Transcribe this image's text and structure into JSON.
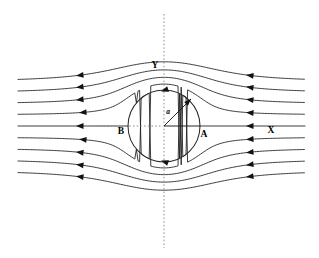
{
  "figure": {
    "background_color": "#ffffff",
    "line_color": "#1a1a1a",
    "axis_color": "#8f8f8f",
    "width": 319,
    "height": 258
  },
  "labels": {
    "top_axis": "Y",
    "right_far_field": "X",
    "right_stagnation": "A",
    "left_stagnation": "B",
    "radius": "a"
  },
  "chart_data": {
    "type": "line",
    "xlabel": "X",
    "ylabel": "Y",
    "grid": false,
    "legend_position": "none",
    "annotations": [
      {
        "text": "Y",
        "x": 155,
        "y": 68,
        "meaning": "vertical-axis-label"
      },
      {
        "text": "X",
        "x": 271,
        "y": 133,
        "meaning": "horizontal-axis-label"
      },
      {
        "text": "A",
        "x": 204,
        "y": 137,
        "meaning": "right-stagnation-point"
      },
      {
        "text": "B",
        "x": 121,
        "y": 134,
        "meaning": "left-stagnation-point"
      },
      {
        "text": "a",
        "x": 168,
        "y": 114,
        "meaning": "cylinder-radius"
      }
    ],
    "cylinder": {
      "center_x": 164,
      "center_y": 126,
      "radius": 36
    },
    "flow_direction": "right-to-left",
    "streamline_count": 9,
    "streamline_offsets": [
      -44,
      -33,
      -22,
      -11,
      0,
      11,
      22,
      33,
      44
    ],
    "x_domain": [
      18,
      305
    ],
    "axis_vertical": {
      "x": 164,
      "y_from": 14,
      "y_to": 248
    },
    "axis_horizontal": {
      "y": 126,
      "x_from": 96,
      "x_to": 232
    },
    "radius_arrow": {
      "from_x": 164,
      "from_y": 126,
      "to_x": 191,
      "to_y": 99,
      "angle_deg": 45
    },
    "radius_line_horizontal": {
      "from_x": 164,
      "from_y": 126,
      "to_x": 200,
      "to_y": 126
    }
  }
}
